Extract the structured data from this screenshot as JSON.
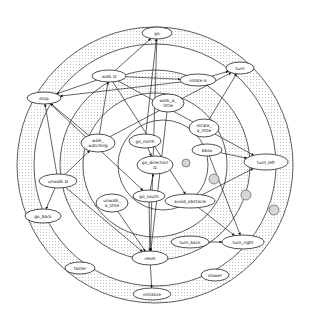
{
  "diagram": {
    "type": "concentric-ring state graph",
    "rings": [
      {
        "name": "outer-dotted-band",
        "cx": 155,
        "cy": 165,
        "r_outer": 138,
        "r_inner": 121,
        "pattern": "dotted"
      },
      {
        "name": "middle-dotted-band",
        "cx": 155,
        "cy": 165,
        "r_outer": 95,
        "r_inner": 72,
        "pattern": "dotted"
      },
      {
        "name": "inner-circle",
        "cx": 163,
        "cy": 165,
        "r": 45,
        "pattern": "white"
      }
    ],
    "nodes": [
      {
        "id": "go",
        "label": "go",
        "x": 157,
        "y": 33,
        "rx": 15,
        "ry": 6
      },
      {
        "id": "walk_D",
        "label": "walk D",
        "x": 109,
        "y": 76,
        "rx": 17,
        "ry": 6
      },
      {
        "id": "rotate_A",
        "label": "rotate A",
        "x": 198,
        "y": 80,
        "rx": 18,
        "ry": 6
      },
      {
        "id": "turn",
        "label": "turn",
        "x": 240,
        "y": 68,
        "rx": 14,
        "ry": 6
      },
      {
        "id": "stop",
        "label": "stop",
        "x": 44,
        "y": 98,
        "rx": 17,
        "ry": 6
      },
      {
        "id": "walk_a_little",
        "label": "walk_a_\nlittle",
        "x": 168,
        "y": 103,
        "rx": 16,
        "ry": 9
      },
      {
        "id": "rotate_a_little",
        "label": "rotate_\na_little",
        "x": 204,
        "y": 128,
        "rx": 15,
        "ry": 9
      },
      {
        "id": "walk_watching",
        "label": "walk_\nwatching",
        "x": 98,
        "y": 143,
        "rx": 17,
        "ry": 9
      },
      {
        "id": "go_north",
        "label": "go_north",
        "x": 145,
        "y": 141,
        "rx": 16,
        "ry": 7
      },
      {
        "id": "go_direction_D",
        "label": "go_direction\nD",
        "x": 155,
        "y": 165,
        "rx": 18,
        "ry": 9
      },
      {
        "id": "bbox",
        "label": "bbox",
        "x": 207,
        "y": 150,
        "rx": 15,
        "ry": 6
      },
      {
        "id": "turn_left",
        "label": "turn_left",
        "x": 266,
        "y": 162,
        "rx": 22,
        "ry": 8
      },
      {
        "id": "unwalk_D",
        "label": "unwalk D",
        "x": 58,
        "y": 181,
        "rx": 19,
        "ry": 7
      },
      {
        "id": "unwalk_a_little",
        "label": "unwalk_\na_little",
        "x": 112,
        "y": 203,
        "rx": 16,
        "ry": 9
      },
      {
        "id": "go_south",
        "label": "go_south",
        "x": 149,
        "y": 196,
        "rx": 16,
        "ry": 6
      },
      {
        "id": "avoid_obstacle",
        "label": "avoid_obstacle",
        "x": 190,
        "y": 201,
        "rx": 25,
        "ry": 7
      },
      {
        "id": "go_back",
        "label": "go_back",
        "x": 43,
        "y": 216,
        "rx": 18,
        "ry": 7
      },
      {
        "id": "turn_back",
        "label": "turn_back",
        "x": 190,
        "y": 242,
        "rx": 19,
        "ry": 6
      },
      {
        "id": "turn_right",
        "label": "turn_right",
        "x": 243,
        "y": 242,
        "rx": 21,
        "ry": 7
      },
      {
        "id": "reset",
        "label": "reset",
        "x": 150,
        "y": 258,
        "rx": 18,
        "ry": 7
      },
      {
        "id": "faster",
        "label": "faster",
        "x": 80,
        "y": 268,
        "rx": 15,
        "ry": 6
      },
      {
        "id": "slower",
        "label": "slower",
        "x": 215,
        "y": 275,
        "rx": 14,
        "ry": 6
      },
      {
        "id": "initialize",
        "label": "initialize",
        "x": 152,
        "y": 294,
        "rx": 19,
        "ry": 6
      }
    ],
    "edges": [
      [
        "walk_D",
        "go"
      ],
      [
        "walk_D",
        "stop"
      ],
      [
        "walk_D",
        "rotate_A"
      ],
      [
        "rotate_A",
        "turn"
      ],
      [
        "rotate_A",
        "stop"
      ],
      [
        "rotate_a_little",
        "turn"
      ],
      [
        "walk_watching",
        "turn"
      ],
      [
        "walk_watching",
        "stop"
      ],
      [
        "walk_watching",
        "walk_D"
      ],
      [
        "go_north",
        "go"
      ],
      [
        "go_north",
        "go_direction_D"
      ],
      [
        "go_south",
        "go_direction_D"
      ],
      [
        "go_south",
        "reset"
      ],
      [
        "bbox",
        "turn_right"
      ],
      [
        "bbox",
        "turn_left"
      ],
      [
        "avoid_obstacle",
        "turn_left"
      ],
      [
        "avoid_obstacle",
        "turn_right"
      ],
      [
        "unwalk_D",
        "stop"
      ],
      [
        "unwalk_D",
        "go_back"
      ],
      [
        "unwalk_D",
        "reset"
      ],
      [
        "unwalk_D",
        "walk_watching"
      ],
      [
        "unwalk_a_little",
        "reset"
      ],
      [
        "turn_back",
        "turn_right"
      ],
      [
        "reset",
        "initialize"
      ],
      [
        "walk_D",
        "avoid_obstacle"
      ],
      [
        "walk_D",
        "turn_left"
      ],
      [
        "stop",
        "go_south"
      ],
      [
        "go",
        "reset"
      ],
      [
        "walk_a_little",
        "reset"
      ]
    ],
    "markers": [
      {
        "name": "gray-circle",
        "x": 186,
        "y": 163,
        "r": 4
      },
      {
        "name": "gray-circle",
        "x": 214,
        "y": 179,
        "r": 5
      },
      {
        "name": "gray-circle",
        "x": 246,
        "y": 195,
        "r": 5
      },
      {
        "name": "gray-circle",
        "x": 274,
        "y": 210,
        "r": 5
      }
    ]
  }
}
